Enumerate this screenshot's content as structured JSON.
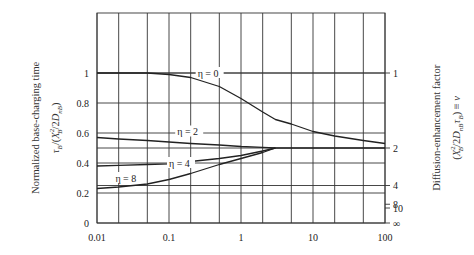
{
  "chart_data": {
    "type": "line",
    "title": "",
    "xlabel": "",
    "xscale": "log",
    "xlim": [
      0.01,
      100
    ],
    "x_ticks": [
      "0.01",
      "0.1",
      "1",
      "10",
      "100"
    ],
    "x_gridlines": [
      0.01,
      0.02,
      0.05,
      0.1,
      0.2,
      0.5,
      1,
      2,
      5,
      10,
      20,
      50,
      100
    ],
    "ylabel": "Normalized base-charging time",
    "ylabel_formula": "τB/(XB²/2DnB)",
    "ylim": [
      0,
      1.4
    ],
    "y_ticks": [
      "0",
      "0.2",
      "0.4",
      "0.6",
      "0.8",
      "1"
    ],
    "y2label": "Diffusion-enhancement factor",
    "y2label_formula": "(XB²/2DnBτB) ≡ ν",
    "y2_ticks": [
      {
        "label": "1",
        "tau": 1.0
      },
      {
        "label": "2",
        "tau": 0.5
      },
      {
        "label": "4",
        "tau": 0.25
      },
      {
        "label": "8",
        "tau": 0.125
      },
      {
        "label": "10",
        "tau": 0.1
      },
      {
        "label": "∞",
        "tau": 0.0
      }
    ],
    "grid": true,
    "x": [
      0.01,
      0.02,
      0.05,
      0.1,
      0.2,
      0.5,
      1,
      2,
      3,
      5,
      10,
      20,
      50,
      100
    ],
    "series": [
      {
        "name": "η = 0",
        "values": [
          1.0,
          1.0,
          1.0,
          0.99,
          0.97,
          0.91,
          0.83,
          0.74,
          0.69,
          0.66,
          0.61,
          0.58,
          0.55,
          0.53
        ]
      },
      {
        "name": "η = 2",
        "values": [
          0.57,
          0.56,
          0.55,
          0.54,
          0.53,
          0.52,
          0.51,
          0.505,
          0.5,
          0.5,
          0.5,
          0.5,
          0.5,
          0.5
        ]
      },
      {
        "name": "η = 4",
        "values": [
          0.38,
          0.385,
          0.39,
          0.395,
          0.41,
          0.43,
          0.45,
          0.48,
          0.5,
          null,
          null,
          null,
          null,
          null
        ]
      },
      {
        "name": "η = 8",
        "values": [
          0.23,
          0.24,
          0.26,
          0.29,
          0.33,
          0.39,
          0.43,
          0.47,
          0.5,
          null,
          null,
          null,
          null,
          null
        ]
      }
    ],
    "annotations": [
      {
        "text": "η = 0",
        "x": 0.25,
        "y": 1.0
      },
      {
        "text": "η = 2",
        "x": 0.13,
        "y": 0.61
      },
      {
        "text": "η = 4",
        "x": 0.1,
        "y": 0.4
      },
      {
        "text": "η = 8",
        "x": 0.018,
        "y": 0.3
      }
    ]
  },
  "labels": {
    "left_title": "Normalized base-charging time",
    "right_title": "Diffusion-enhancement factor"
  }
}
